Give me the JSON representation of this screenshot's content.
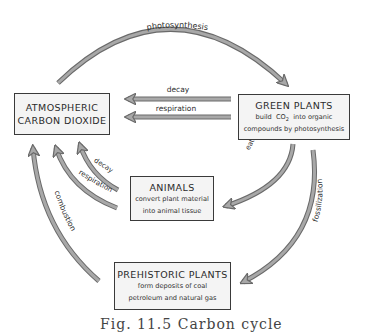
{
  "diagram": {
    "title": "Carbon cycle",
    "nodes": {
      "atmosphere": {
        "title_line1": "ATMOSPHERIC",
        "title_line2": "CARBON DIOXIDE"
      },
      "green_plants": {
        "title": "GREEN PLANTS",
        "sub_line1_a": "build",
        "sub_line1_co": "CO",
        "sub_line1_sub": "2",
        "sub_line1_b": "into organic",
        "sub_line2": "compounds by photosynthesis"
      },
      "animals": {
        "title": "ANIMALS",
        "sub_line1": "convert plant material",
        "sub_line2": "into animal tissue"
      },
      "prehistoric": {
        "title": "PREHISTORIC PLANTS",
        "sub_line1": "form deposits of coal",
        "sub_line2": "petroleum and natural gas"
      }
    },
    "arrows": {
      "photosynthesis": "photosynthesis",
      "plants_decay": "decay",
      "plants_respiration": "respiration",
      "animals_decay": "decay",
      "animals_respiration": "respiration",
      "combustion": "combustion",
      "eaten": "eaten",
      "fossilization": "fossilization"
    },
    "colors": {
      "arrow_fill": "#a8a8a8",
      "arrow_stroke": "#6a6a6a",
      "box_border": "#3a3a3a"
    }
  },
  "caption": "Fig. 11.5  Carbon cycle"
}
